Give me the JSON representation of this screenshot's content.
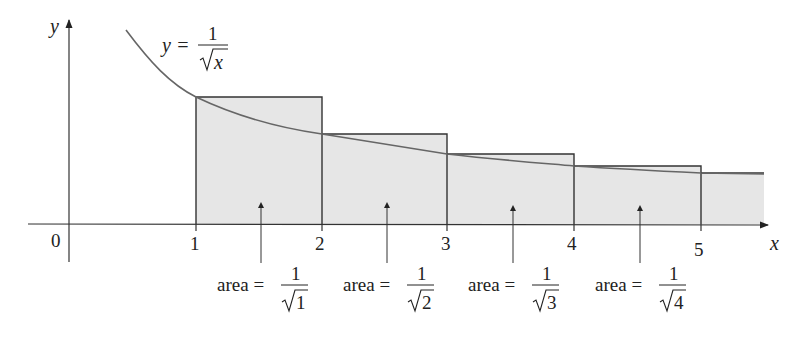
{
  "figure": {
    "axes": {
      "x_label": "x",
      "y_label": "y",
      "origin_label": "0",
      "x_ticks": [
        "1",
        "2",
        "3",
        "4",
        "5"
      ]
    },
    "curve_label": {
      "lhs": "y =",
      "numerator": "1",
      "denominator": "x"
    },
    "area_labels": [
      {
        "prefix": "area =",
        "numerator": "1",
        "radicand": "1"
      },
      {
        "prefix": "area =",
        "numerator": "1",
        "radicand": "2"
      },
      {
        "prefix": "area =",
        "numerator": "1",
        "radicand": "3"
      },
      {
        "prefix": "area =",
        "numerator": "1",
        "radicand": "4"
      }
    ],
    "colors": {
      "fill": "#e6e6e6",
      "stroke": "#333333",
      "curve": "#666666"
    }
  }
}
